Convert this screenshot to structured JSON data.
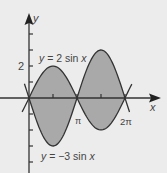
{
  "colors": {
    "background": "#ececec",
    "fill": "#a9a9a9",
    "curve": "#333333",
    "axis": "#333333",
    "text": "#444444"
  },
  "labels": {
    "y_axis": "y",
    "x_axis": "x",
    "y_tick_2": "2",
    "pi": "π",
    "two_pi": "2π",
    "curve1": "y = 2 sin x",
    "curve2": "y = −3 sin x"
  },
  "chart_data": {
    "type": "area",
    "title": "",
    "xlabel": "x",
    "ylabel": "y",
    "series": [
      {
        "name": "y = 2 sin x",
        "function": "2*sin(x)",
        "x_range": [
          -0.45,
          6.73
        ]
      },
      {
        "name": "y = -3 sin x",
        "function": "-3*sin(x)",
        "x_range": [
          -0.3,
          6.58
        ]
      }
    ],
    "shaded_region": {
      "between": [
        "y = 2 sin x",
        "y = -3 sin x"
      ],
      "x_range": [
        0,
        6.2832
      ]
    },
    "x_ticks": [
      {
        "value": 1.5708,
        "label": ""
      },
      {
        "value": 3.1416,
        "label": "π"
      },
      {
        "value": 4.7124,
        "label": ""
      },
      {
        "value": 6.2832,
        "label": "2π"
      }
    ],
    "y_ticks": [
      {
        "value": -4,
        "label": ""
      },
      {
        "value": -3,
        "label": ""
      },
      {
        "value": -2,
        "label": ""
      },
      {
        "value": -1,
        "label": ""
      },
      {
        "value": 1,
        "label": ""
      },
      {
        "value": 2,
        "label": "2"
      },
      {
        "value": 3,
        "label": ""
      },
      {
        "value": 4,
        "label": ""
      }
    ],
    "key_points": [
      {
        "x": 1.5708,
        "y1": 2,
        "y2": -3
      },
      {
        "x": 4.7124,
        "y1": -2,
        "y2": 3
      },
      {
        "x": 0,
        "y": 0
      },
      {
        "x": 3.1416,
        "y": 0
      },
      {
        "x": 6.2832,
        "y": 0
      }
    ],
    "xlim": [
      -0.6,
      8.4
    ],
    "ylim": [
      -4.7,
      5.3
    ],
    "grid": false,
    "legend": "inline annotations"
  }
}
